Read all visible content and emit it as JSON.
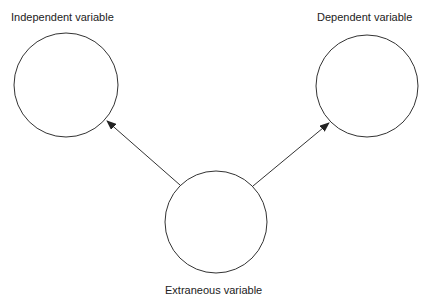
{
  "diagram": {
    "nodes": [
      {
        "id": "independent",
        "label": "Independent variable",
        "cx": 66,
        "cy": 85,
        "r": 52
      },
      {
        "id": "dependent",
        "label": "Dependent variable",
        "cx": 367,
        "cy": 86,
        "r": 51
      },
      {
        "id": "extraneous",
        "label": "Extraneous variable",
        "cx": 216,
        "cy": 222,
        "r": 51
      }
    ],
    "edges": [
      {
        "from": "extraneous",
        "to": "independent"
      },
      {
        "from": "extraneous",
        "to": "dependent"
      }
    ]
  }
}
